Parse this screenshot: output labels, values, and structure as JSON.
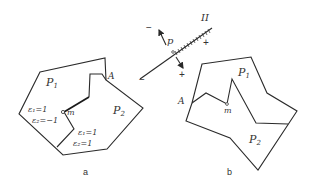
{
  "figure_a": {
    "caption": "a",
    "region_1": "P",
    "region_1_sub": "1",
    "region_2": "P",
    "region_2_sub": "2",
    "point_A": "A",
    "point_m": "m",
    "left_eq_1": "ε₁=1",
    "left_eq_2": "ε₂=−1",
    "right_eq_1": "ε₁=1",
    "right_eq_2": "ε₂=1"
  },
  "figure_b": {
    "caption": "b",
    "region_1": "P",
    "region_1_sub": "1",
    "region_2": "P",
    "region_2_sub": "2",
    "point_A": "A",
    "point_m": "m"
  },
  "line_figure": {
    "label_line": "II",
    "label_point": "p",
    "minus_upper": "−",
    "plus_upper": "+",
    "plus_lower": "+",
    "minus_lower": "−"
  }
}
